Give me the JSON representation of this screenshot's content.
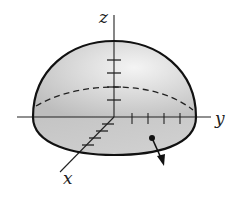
{
  "diagram": {
    "type": "hemisphere-surface-with-normal",
    "axes": {
      "x": {
        "label": "x",
        "ticks": 4
      },
      "y": {
        "label": "y",
        "ticks": 4
      },
      "z": {
        "label": "z",
        "ticks": 4
      }
    },
    "shape": "upper hemisphere with flat circular base",
    "equator_style": "dashed",
    "normal_vector": "outward arrow on base surface",
    "colors": {
      "fill": "#cfcfcf",
      "highlight": "#f2f2f2",
      "stroke": "#111111",
      "axis": "#222222"
    }
  }
}
